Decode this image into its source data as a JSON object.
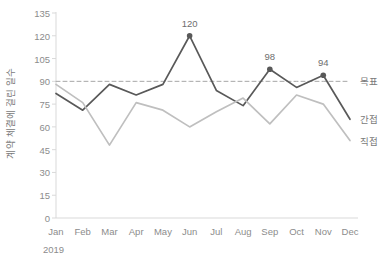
{
  "chart_data": {
    "type": "line",
    "title": "",
    "xlabel": "",
    "ylabel": "계약 체결에 걸린 일수",
    "period": "2019",
    "categories": [
      "Jan",
      "Feb",
      "Mar",
      "Apr",
      "May",
      "Jun",
      "Jul",
      "Aug",
      "Sep",
      "Oct",
      "Nov",
      "Dec"
    ],
    "ylim": [
      0,
      135
    ],
    "yticks": [
      0,
      15,
      30,
      45,
      60,
      75,
      90,
      105,
      120,
      135
    ],
    "grid": false,
    "legend_position": "right-inline",
    "series": [
      {
        "name": "목표",
        "style": "dashed",
        "color": "#a6a6a6",
        "constant": 90,
        "values": [
          90,
          90,
          90,
          90,
          90,
          90,
          90,
          90,
          90,
          90,
          90,
          90
        ]
      },
      {
        "name": "간접",
        "style": "solid",
        "color": "#595959",
        "values": [
          82,
          71,
          88,
          81,
          88,
          120,
          84,
          74,
          98,
          86,
          94,
          65
        ]
      },
      {
        "name": "직접",
        "style": "solid",
        "color": "#bfbfbf",
        "values": [
          88,
          76,
          48,
          76,
          71,
          60,
          70,
          79,
          62,
          81,
          75,
          51
        ]
      }
    ],
    "point_labels": [
      {
        "series": "간접",
        "category": "Jun",
        "value": 120,
        "text": "120"
      },
      {
        "series": "간접",
        "category": "Sep",
        "value": 98,
        "text": "98"
      },
      {
        "series": "간접",
        "category": "Nov",
        "value": 94,
        "text": "94"
      }
    ],
    "axis_color": "#d9d9d9",
    "background": "#ffffff"
  }
}
